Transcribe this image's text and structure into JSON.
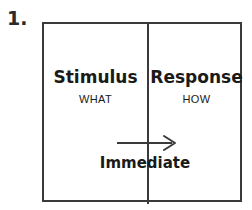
{
  "figure": {
    "item_number": "1.",
    "cells": [
      {
        "id": "stimulus",
        "heading": "Stimulus",
        "subheading": "WHAT"
      },
      {
        "id": "response",
        "heading": "Response",
        "subheading": "HOW"
      }
    ],
    "flow": {
      "label": "Immediate",
      "arrow_icon": "arrow-right-icon",
      "direction": "left-to-right"
    },
    "colors": {
      "background": "#ffffff",
      "border": "#3a3a3a",
      "text": "#1a1a1a",
      "number_text": "#2b2b2b",
      "arrow": "#3a3a3a"
    }
  }
}
